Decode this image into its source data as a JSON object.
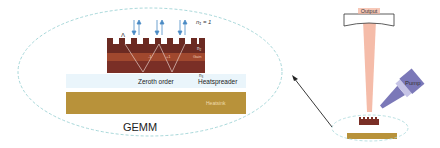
{
  "diagram": {
    "title": "GEMM",
    "labels": {
      "n1": "n₁ = 1",
      "lambda": "Λ",
      "n2": "n₂",
      "gain": "Gain",
      "n3": "n₃",
      "zeroth_order": "Zeroth order",
      "heatspreader": "Heatspreader",
      "heatsink": "Heatsink",
      "minus_one": "-1",
      "plus_one": "+1",
      "output": "Output",
      "pump": "Pump"
    },
    "colors": {
      "grating": "#6b2a22",
      "gain": "#a0482e",
      "substrate": "#7a2f26",
      "heatspreader": "#e8f4fa",
      "heatsink": "#b8923a",
      "ellipse": "#9fd6d6",
      "beam": "#f3b09a",
      "pump_body": "#7b78b8",
      "arrow": "#222222"
    }
  }
}
